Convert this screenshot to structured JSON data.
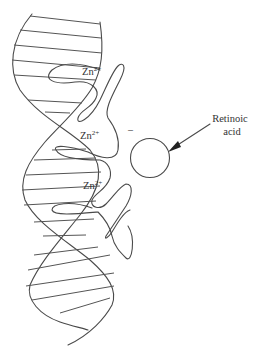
{
  "figure": {
    "labels": {
      "zn1": "Zn",
      "zn1_sup": "2+",
      "zn2": "Zn",
      "zn2_sup": "2+",
      "zn3": "Zn",
      "zn3_sup": "2+",
      "minus": "–",
      "retinoic_line1": "Retinoic",
      "retinoic_line2": "acid"
    },
    "colors": {
      "line": "#4a4a4a",
      "text": "#333333",
      "background": "#ffffff"
    }
  }
}
